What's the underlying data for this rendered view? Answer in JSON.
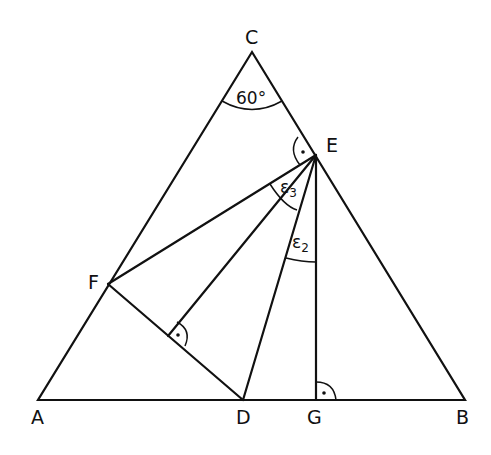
{
  "diagram": {
    "type": "geometry",
    "points": {
      "A": {
        "label": "A",
        "x": 38,
        "y": 400
      },
      "B": {
        "label": "B",
        "x": 465,
        "y": 400
      },
      "C": {
        "label": "C",
        "x": 252,
        "y": 52
      },
      "D": {
        "label": "D",
        "x": 243,
        "y": 400
      },
      "E": {
        "label": "E",
        "x": 316,
        "y": 155
      },
      "F": {
        "label": "F",
        "x": 108,
        "y": 284
      },
      "G": {
        "label": "G",
        "x": 316,
        "y": 400
      }
    },
    "angles": {
      "C": {
        "text": "60°"
      },
      "eps3": {
        "symbol": "ε",
        "sub": "3"
      },
      "eps2": {
        "symbol": "ε",
        "sub": "2"
      }
    },
    "right_angle_marks": [
      "E (between CE and EF)",
      "foot of perpendicular from E on FD",
      "G"
    ]
  }
}
